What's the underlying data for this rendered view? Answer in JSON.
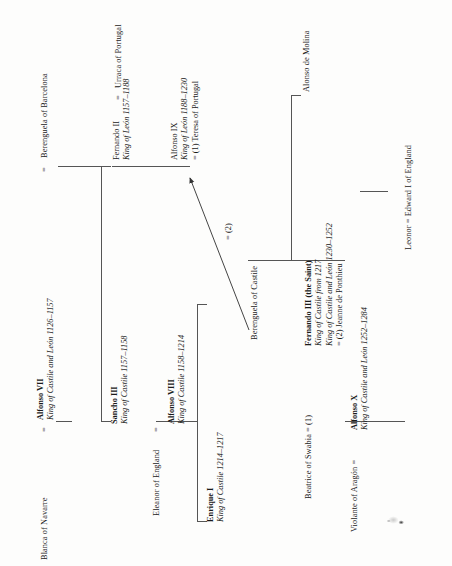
{
  "chart": {
    "orientation": "rotated-90-counterclockwise",
    "generations": 5
  },
  "people": {
    "alfonso_vii": {
      "name": "Alfonso VII",
      "titles": "King of Castile and León 1126–1157"
    },
    "berenguela_barcelona": {
      "name": "Berenguela of Barcelona"
    },
    "blanca_navarre": {
      "name": "Blanca of Navarre"
    },
    "sancho_iii": {
      "name": "Sancho III",
      "titles": "King of Castile 1157–1158"
    },
    "fernando_ii": {
      "name": "Fernando II",
      "titles": "King of León 1157–1188"
    },
    "urraca_portugal": {
      "name": "Urraca of Portugal"
    },
    "eleanor_england": {
      "name": "Eleanor of England"
    },
    "alfonso_viii": {
      "name": "Alfonso VIII",
      "titles": "King of Castile 1158–1214"
    },
    "alfonso_ix": {
      "name": "Alfonso IX",
      "titles": "King of León 1188–1230",
      "marriage1": "= (1) Teresa of Portugal"
    },
    "berenguela_castile": {
      "name": "Berenguela of Castile"
    },
    "enrique_i": {
      "name": "Enrique I",
      "titles": "King of Castile 1214–1217"
    },
    "fernando_iii": {
      "name": "Fernando III (the Saint)",
      "titles_1": "King of Castile from 1217",
      "titles_2": "King of Castile and León 1230–1252",
      "marriage2": "= (2) Jeanne de Ponthieu"
    },
    "beatrice_swabia": {
      "name": "Beatrice of Swabia"
    },
    "alonso_molina": {
      "name": "Alonso de Molina"
    },
    "alfonso_x": {
      "name": "Alfonso X",
      "titles": "King of Castile and León 1252–1284"
    },
    "violante_aragon": {
      "name": "Violante of Aragón"
    },
    "leonor": {
      "name": "Leonor"
    },
    "edward_i": {
      "name": "Edward I of England"
    }
  },
  "symbols": {
    "equals": "=",
    "equals_1": "=",
    "equals_2": "=",
    "equals_3": "=",
    "equals_4": "=",
    "equals_leonor": "=",
    "second_marriage_label": "= (2)"
  },
  "composites": {
    "beatrice_marriage": "Beatrice of Swabia  =  (1)",
    "violante_marriage": "Violante of Aragón  =",
    "leonor_marriage": "Leonor  =  Edward I of England"
  },
  "colors": {
    "ink": "#1a1a1a",
    "rule": "#555555",
    "paper": "#fdfdfc"
  }
}
